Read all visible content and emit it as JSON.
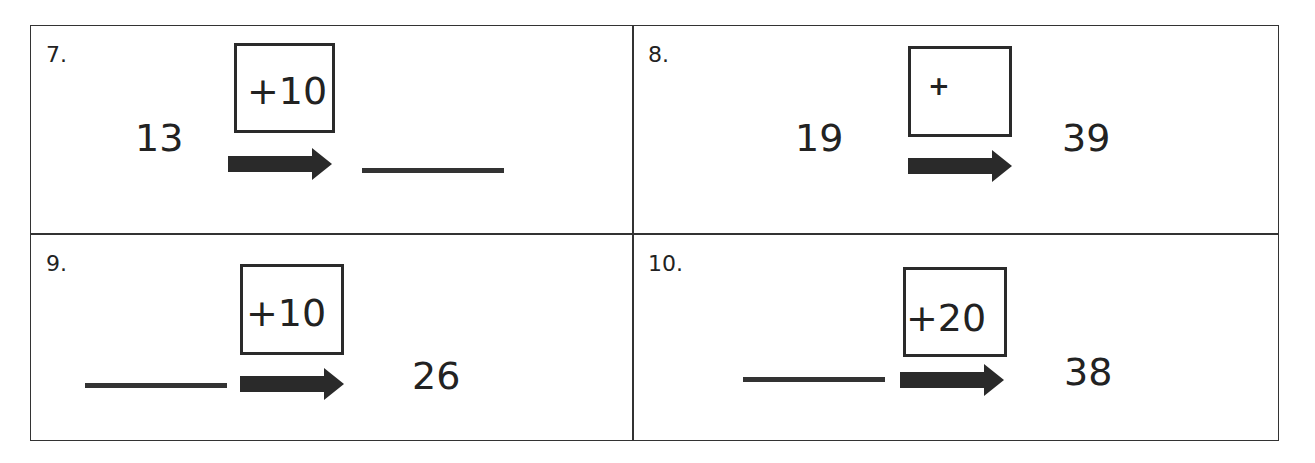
{
  "problems": [
    {
      "label": "7.",
      "start": "13",
      "operator": "+10",
      "end": "",
      "start_blank": false,
      "end_blank": true
    },
    {
      "label": "8.",
      "start": "19",
      "operator": "+",
      "end": "39",
      "start_blank": false,
      "end_blank": false
    },
    {
      "label": "9.",
      "start": "",
      "operator": "+10",
      "end": "26",
      "start_blank": true,
      "end_blank": false
    },
    {
      "label": "10.",
      "start": "",
      "operator": "+20",
      "end": "38",
      "start_blank": true,
      "end_blank": false
    }
  ]
}
